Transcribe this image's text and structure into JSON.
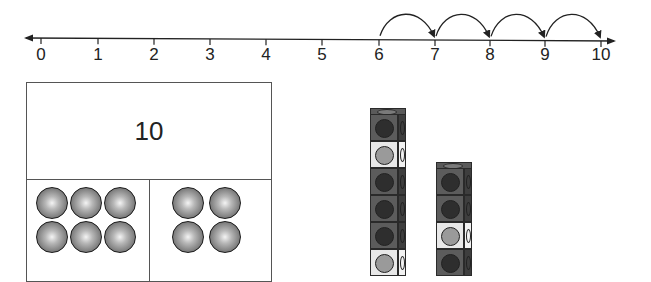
{
  "number_line": {
    "min": 0,
    "max": 10,
    "tick_labels": [
      "0",
      "1",
      "2",
      "3",
      "4",
      "5",
      "6",
      "7",
      "8",
      "9",
      "10"
    ],
    "tick_x": [
      41,
      98,
      154,
      210,
      266,
      322,
      379,
      435,
      490,
      545,
      601
    ],
    "jumps": [
      {
        "from": 6,
        "to": 7
      },
      {
        "from": 7,
        "to": 8
      },
      {
        "from": 8,
        "to": 9
      },
      {
        "from": 9,
        "to": 10
      }
    ],
    "line_color": "#222222"
  },
  "number_bond": {
    "whole": "10",
    "parts": [
      {
        "name": "left",
        "count": 6,
        "columns": 3
      },
      {
        "name": "right",
        "count": 4,
        "columns": 2
      }
    ],
    "counter_color": "#7a7a7a",
    "border_color": "#555555"
  },
  "cube_towers": [
    {
      "name": "tower-1",
      "visible_cubes": [
        "dark",
        "light",
        "dark",
        "dark",
        "dark",
        "light"
      ]
    },
    {
      "name": "tower-2",
      "visible_cubes": [
        "dark",
        "dark",
        "light",
        "dark"
      ]
    }
  ],
  "colors": {
    "cube_dark_face": "#5c5c5c",
    "cube_dark_dot": "#2e2e2e",
    "cube_light_face": "#e8e8e8",
    "cube_light_dot": "#9a9a9a"
  }
}
